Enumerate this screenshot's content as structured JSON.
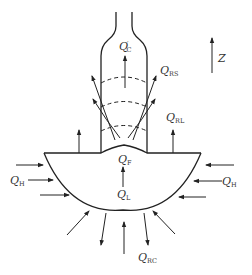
{
  "diagram": {
    "axis": {
      "label": "Z",
      "direction": "up"
    },
    "labels": {
      "qc_prime": {
        "main": "Q",
        "prime": "′",
        "sub": "C"
      },
      "qrs": {
        "main": "Q",
        "sub": "RS"
      },
      "qrl": {
        "main": "Q",
        "sub": "RL"
      },
      "qf": {
        "main": "Q",
        "sub": "F"
      },
      "ql": {
        "main": "Q",
        "sub": "L"
      },
      "qh_left": {
        "main": "Q",
        "sub": "H"
      },
      "qh_right": {
        "main": "Q",
        "sub": "H"
      },
      "qrc": {
        "main": "Q",
        "sub": "RC"
      }
    },
    "colors": {
      "stroke": "#222222",
      "text": "#333333",
      "background": "#ffffff"
    }
  }
}
